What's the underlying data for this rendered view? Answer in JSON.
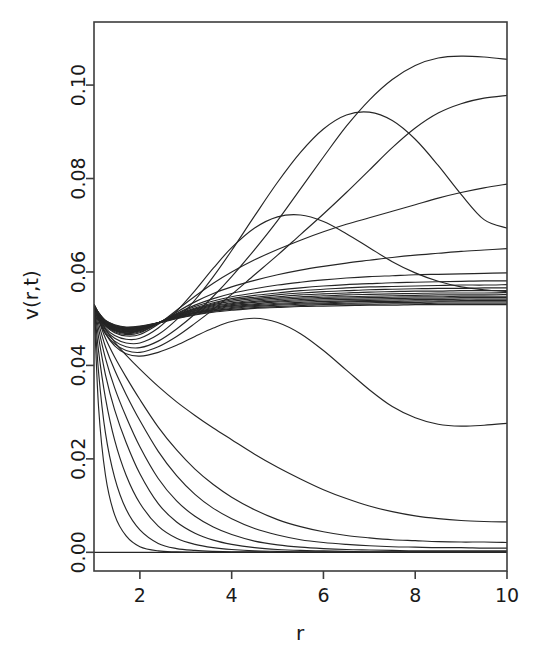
{
  "chart_data": {
    "type": "line",
    "title": "",
    "subtitle": "",
    "xlabel": "r",
    "ylabel": "v(r,t)",
    "xlim": [
      1,
      10
    ],
    "ylim": [
      -0.004,
      0.1135
    ],
    "grid": false,
    "legend": false,
    "legend_position": "none",
    "line_color": "#262626",
    "axis_color": "#3d3d3d",
    "background": "#ffffff",
    "x_ticks": [
      2,
      4,
      6,
      8,
      10
    ],
    "x_tick_labels": [
      "2",
      "4",
      "6",
      "8",
      "10"
    ],
    "y_ticks": [
      0.0,
      0.02,
      0.04,
      0.06,
      0.08,
      0.1
    ],
    "y_tick_labels": [
      "0.00",
      "0.02",
      "0.04",
      "0.06",
      "0.08",
      "0.10"
    ],
    "x": [
      1,
      1.1,
      1.25,
      1.45,
      1.7,
      2,
      2.4,
      2.8,
      3.2,
      3.6,
      4,
      4.5,
      5,
      5.5,
      6,
      6.5,
      7,
      7.5,
      8,
      8.5,
      9,
      9.5,
      10
    ],
    "series": [
      {
        "name": "t01",
        "values": [
          0.053,
          0.031,
          0.0165,
          0.008,
          0.0035,
          0.0012,
          0.0003,
          0.0001,
          0.0,
          0.0,
          0.0,
          0.0,
          0.0,
          0.0,
          0.0,
          0.0,
          0.0,
          0.0,
          0.0,
          0.0,
          0.0,
          0.0,
          0.0
        ]
      },
      {
        "name": "t02",
        "values": [
          0.053,
          0.0385,
          0.0255,
          0.016,
          0.0092,
          0.0048,
          0.0019,
          0.0008,
          0.0004,
          0.0002,
          0.0001,
          0.0001,
          0.0,
          0.0,
          0.0,
          0.0,
          0.0,
          0.0,
          0.0,
          0.0,
          0.0,
          0.0,
          0.0
        ]
      },
      {
        "name": "t03",
        "values": [
          0.053,
          0.043,
          0.033,
          0.024,
          0.0165,
          0.0105,
          0.0056,
          0.003,
          0.0017,
          0.001,
          0.0006,
          0.0003,
          0.0002,
          0.0001,
          0.0001,
          0.0,
          0.0,
          0.0,
          0.0,
          0.0,
          0.0,
          0.0,
          0.0
        ]
      },
      {
        "name": "t04",
        "values": [
          0.053,
          0.046,
          0.038,
          0.0305,
          0.0235,
          0.0168,
          0.0104,
          0.0065,
          0.0041,
          0.0026,
          0.0017,
          0.001,
          0.0006,
          0.0004,
          0.0003,
          0.0002,
          0.0001,
          0.0001,
          0.0001,
          0.0001,
          0.0001,
          0.0001,
          0.0001
        ]
      },
      {
        "name": "t05",
        "values": [
          0.053,
          0.0478,
          0.0415,
          0.0352,
          0.029,
          0.0226,
          0.0158,
          0.011,
          0.0077,
          0.0054,
          0.0038,
          0.0024,
          0.0016,
          0.0011,
          0.0008,
          0.0006,
          0.0005,
          0.0004,
          0.0003,
          0.0003,
          0.0003,
          0.0003,
          0.0003
        ]
      },
      {
        "name": "t06",
        "values": [
          0.053,
          0.049,
          0.044,
          0.039,
          0.0338,
          0.0282,
          0.0216,
          0.0164,
          0.0124,
          0.0094,
          0.0072,
          0.0051,
          0.0037,
          0.0027,
          0.0021,
          0.0017,
          0.0014,
          0.0012,
          0.0011,
          0.001,
          0.001,
          0.0009,
          0.0009
        ]
      },
      {
        "name": "t07",
        "values": [
          0.053,
          0.0498,
          0.0458,
          0.0418,
          0.0375,
          0.0327,
          0.0268,
          0.0219,
          0.0178,
          0.0145,
          0.0118,
          0.0091,
          0.007,
          0.0055,
          0.0044,
          0.0036,
          0.0031,
          0.0027,
          0.0025,
          0.0023,
          0.0022,
          0.0022,
          0.0021
        ]
      },
      {
        "name": "t08",
        "values": [
          0.053,
          0.0506,
          0.0478,
          0.045,
          0.0422,
          0.0392,
          0.0355,
          0.0322,
          0.0293,
          0.0266,
          0.0241,
          0.021,
          0.0182,
          0.0157,
          0.0134,
          0.0115,
          0.0099,
          0.0087,
          0.0078,
          0.0072,
          0.0068,
          0.0066,
          0.0065
        ]
      },
      {
        "name": "t09",
        "values": [
          0.053,
          0.05,
          0.0468,
          0.0442,
          0.0425,
          0.042,
          0.0428,
          0.0443,
          0.0462,
          0.048,
          0.0494,
          0.0501,
          0.0492,
          0.0468,
          0.0432,
          0.039,
          0.0348,
          0.0312,
          0.0288,
          0.0274,
          0.027,
          0.0272,
          0.0276
        ]
      },
      {
        "name": "t10",
        "values": [
          0.053,
          0.0498,
          0.0468,
          0.0446,
          0.0432,
          0.0428,
          0.044,
          0.0462,
          0.049,
          0.052,
          0.0552,
          0.0594,
          0.0636,
          0.068,
          0.0724,
          0.077,
          0.0818,
          0.0866,
          0.0908,
          0.094,
          0.096,
          0.0972,
          0.0978
        ]
      },
      {
        "name": "t11",
        "values": [
          0.053,
          0.05,
          0.0472,
          0.0452,
          0.044,
          0.0438,
          0.0452,
          0.0478,
          0.051,
          0.0548,
          0.059,
          0.0648,
          0.071,
          0.0778,
          0.0846,
          0.0912,
          0.0968,
          0.1012,
          0.1042,
          0.1058,
          0.1062,
          0.106,
          0.1055
        ]
      },
      {
        "name": "t12",
        "values": [
          0.053,
          0.0502,
          0.0476,
          0.0458,
          0.0448,
          0.0448,
          0.0466,
          0.0498,
          0.054,
          0.059,
          0.0646,
          0.072,
          0.0792,
          0.0856,
          0.0906,
          0.0936,
          0.0942,
          0.0924,
          0.0884,
          0.0828,
          0.0766,
          0.0712,
          0.0694
        ]
      },
      {
        "name": "t13",
        "values": [
          0.053,
          0.0504,
          0.048,
          0.0464,
          0.0456,
          0.0458,
          0.048,
          0.0516,
          0.056,
          0.0608,
          0.0652,
          0.0694,
          0.0718,
          0.0722,
          0.0708,
          0.0682,
          0.0652,
          0.0622,
          0.0598,
          0.058,
          0.0568,
          0.0562,
          0.0558
        ]
      },
      {
        "name": "t14",
        "values": [
          0.053,
          0.0506,
          0.0484,
          0.047,
          0.0463,
          0.0466,
          0.0488,
          0.0518,
          0.0548,
          0.0576,
          0.06,
          0.0626,
          0.0648,
          0.0668,
          0.0686,
          0.0702,
          0.0716,
          0.073,
          0.0744,
          0.0758,
          0.077,
          0.078,
          0.0788
        ]
      },
      {
        "name": "t15",
        "values": [
          0.053,
          0.0506,
          0.0485,
          0.0472,
          0.0466,
          0.047,
          0.049,
          0.0514,
          0.0536,
          0.0554,
          0.0568,
          0.0582,
          0.0594,
          0.0604,
          0.0612,
          0.0619,
          0.0625,
          0.0631,
          0.0636,
          0.064,
          0.0644,
          0.0647,
          0.065
        ]
      },
      {
        "name": "t16",
        "values": [
          0.053,
          0.0507,
          0.0486,
          0.0474,
          0.0468,
          0.0472,
          0.049,
          0.0511,
          0.0529,
          0.0543,
          0.0554,
          0.0564,
          0.0572,
          0.0578,
          0.0583,
          0.0587,
          0.059,
          0.0592,
          0.0594,
          0.0595,
          0.0596,
          0.0597,
          0.0598
        ]
      },
      {
        "name": "t17",
        "values": [
          0.053,
          0.0507,
          0.0487,
          0.0475,
          0.047,
          0.0474,
          0.0491,
          0.051,
          0.0526,
          0.0538,
          0.0547,
          0.0555,
          0.0561,
          0.0566,
          0.057,
          0.0573,
          0.0575,
          0.0577,
          0.0578,
          0.0579,
          0.058,
          0.0581,
          0.0581
        ]
      },
      {
        "name": "t18",
        "values": [
          0.053,
          0.0508,
          0.0488,
          0.0476,
          0.0471,
          0.0475,
          0.0491,
          0.0509,
          0.0523,
          0.0534,
          0.0543,
          0.055,
          0.0555,
          0.056,
          0.0563,
          0.0566,
          0.0568,
          0.0569,
          0.057,
          0.0571,
          0.0572,
          0.0572,
          0.0573
        ]
      },
      {
        "name": "t19",
        "values": [
          0.053,
          0.0508,
          0.0489,
          0.0477,
          0.0472,
          0.0476,
          0.0491,
          0.0508,
          0.0521,
          0.0532,
          0.054,
          0.0546,
          0.0551,
          0.0555,
          0.0558,
          0.056,
          0.0562,
          0.0563,
          0.0564,
          0.0565,
          0.0565,
          0.0566,
          0.0566
        ]
      },
      {
        "name": "t20",
        "values": [
          0.053,
          0.0509,
          0.049,
          0.0478,
          0.0473,
          0.0477,
          0.0491,
          0.0507,
          0.052,
          0.053,
          0.0537,
          0.0543,
          0.0547,
          0.0551,
          0.0553,
          0.0555,
          0.0557,
          0.0558,
          0.0559,
          0.0559,
          0.056,
          0.056,
          0.056
        ]
      },
      {
        "name": "t21",
        "values": [
          0.053,
          0.0509,
          0.049,
          0.0479,
          0.0474,
          0.0478,
          0.0491,
          0.0506,
          0.0518,
          0.0528,
          0.0534,
          0.054,
          0.0544,
          0.0547,
          0.0549,
          0.0551,
          0.0552,
          0.0553,
          0.0554,
          0.0555,
          0.0555,
          0.0555,
          0.0556
        ]
      },
      {
        "name": "t22",
        "values": [
          0.053,
          0.051,
          0.0491,
          0.048,
          0.0475,
          0.0478,
          0.0491,
          0.0505,
          0.0517,
          0.0526,
          0.0532,
          0.0537,
          0.0541,
          0.0544,
          0.0546,
          0.0547,
          0.0548,
          0.0549,
          0.055,
          0.0551,
          0.0551,
          0.0551,
          0.0552
        ]
      },
      {
        "name": "t23",
        "values": [
          0.053,
          0.051,
          0.0492,
          0.0481,
          0.0476,
          0.0479,
          0.0491,
          0.0505,
          0.0516,
          0.0524,
          0.053,
          0.0535,
          0.0538,
          0.0541,
          0.0543,
          0.0544,
          0.0545,
          0.0546,
          0.0547,
          0.0547,
          0.0548,
          0.0548,
          0.0548
        ]
      },
      {
        "name": "t24",
        "values": [
          0.053,
          0.0511,
          0.0493,
          0.0482,
          0.0477,
          0.048,
          0.0491,
          0.0504,
          0.0514,
          0.0522,
          0.0528,
          0.0532,
          0.0536,
          0.0538,
          0.054,
          0.0541,
          0.0542,
          0.0543,
          0.0544,
          0.0544,
          0.0545,
          0.0545,
          0.0545
        ]
      },
      {
        "name": "t25",
        "values": [
          0.053,
          0.0511,
          0.0493,
          0.0483,
          0.0478,
          0.048,
          0.0491,
          0.0503,
          0.0513,
          0.052,
          0.0526,
          0.053,
          0.0533,
          0.0535,
          0.0537,
          0.0538,
          0.0539,
          0.054,
          0.0541,
          0.0541,
          0.0542,
          0.0542,
          0.0542
        ]
      },
      {
        "name": "t26",
        "values": [
          0.053,
          0.0512,
          0.0494,
          0.0484,
          0.0479,
          0.0481,
          0.0491,
          0.0502,
          0.0512,
          0.0519,
          0.0524,
          0.0528,
          0.0531,
          0.0533,
          0.0534,
          0.0536,
          0.0537,
          0.0537,
          0.0538,
          0.0538,
          0.0539,
          0.0539,
          0.0539
        ]
      },
      {
        "name": "t27",
        "values": [
          0.053,
          0.0512,
          0.0495,
          0.0485,
          0.048,
          0.0482,
          0.0491,
          0.0502,
          0.0511,
          0.0517,
          0.0522,
          0.0526,
          0.0529,
          0.0531,
          0.0532,
          0.0533,
          0.0534,
          0.0535,
          0.0535,
          0.0536,
          0.0536,
          0.0536,
          0.0536
        ]
      },
      {
        "name": "t28",
        "values": [
          0.053,
          0.0513,
          0.0496,
          0.0486,
          0.0481,
          0.0483,
          0.0491,
          0.0501,
          0.0509,
          0.0516,
          0.052,
          0.0524,
          0.0526,
          0.0528,
          0.053,
          0.0531,
          0.0531,
          0.0532,
          0.0532,
          0.0533,
          0.0533,
          0.0533,
          0.0533
        ]
      },
      {
        "name": "t29",
        "values": [
          0.053,
          0.0513,
          0.0496,
          0.0487,
          0.0482,
          0.0484,
          0.0491,
          0.05,
          0.0508,
          0.0514,
          0.0518,
          0.0522,
          0.0524,
          0.0526,
          0.0527,
          0.0528,
          0.0529,
          0.0529,
          0.053,
          0.053,
          0.053,
          0.053,
          0.053
        ]
      },
      {
        "name": "t_zero",
        "values": [
          0.0,
          0.0,
          0.0,
          0.0,
          0.0,
          0.0,
          0.0,
          0.0,
          0.0,
          0.0,
          0.0,
          0.0,
          0.0,
          0.0,
          0.0,
          0.0,
          0.0,
          0.0,
          0.0,
          0.0,
          0.0,
          0.0,
          0.0
        ]
      }
    ]
  },
  "axes": {
    "x_title": "r",
    "y_title": "v(r,t)"
  }
}
